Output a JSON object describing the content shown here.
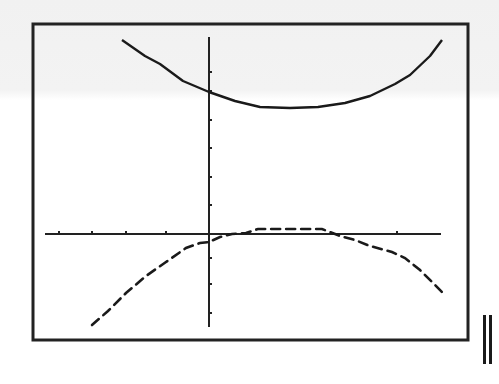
{
  "screen": {
    "title": "",
    "window": "calculator-graph-screen",
    "frame_color": "#222222",
    "background_color": "#ffffff"
  },
  "chart_data": {
    "type": "line",
    "title": "",
    "xlabel": "",
    "ylabel": "",
    "grid": false,
    "legend": null,
    "axes": {
      "x_ticks_px": [
        59,
        92,
        126,
        166,
        397
      ],
      "y_ticks_px": [
        72,
        91,
        120,
        148,
        177,
        205,
        258,
        284,
        313
      ],
      "x_axis_y_px": 234,
      "y_axis_x_px": 209,
      "x_range_px": [
        45,
        441
      ],
      "y_range_px": [
        37,
        327
      ],
      "approx_xlim": [
        -5,
        7
      ],
      "approx_ylim": [
        -3,
        6
      ]
    },
    "series": [
      {
        "name": "upper-curve",
        "style": "solid-with-gaps",
        "description": "Upward-opening parabola above the x-axis, vertex near x≈2.8 units right of the y-axis",
        "points_px": [
          [
            122,
            40
          ],
          [
            145,
            56
          ],
          [
            160,
            64
          ],
          [
            183,
            81
          ],
          [
            209,
            92
          ],
          [
            235,
            101
          ],
          [
            260,
            107
          ],
          [
            290,
            108
          ],
          [
            318,
            107
          ],
          [
            345,
            103
          ],
          [
            370,
            96
          ],
          [
            395,
            84
          ],
          [
            410,
            75
          ],
          [
            430,
            56
          ],
          [
            442,
            40
          ]
        ]
      },
      {
        "name": "lower-curve",
        "style": "dashed",
        "description": "Downward-opening curve below/near the x-axis, flat top just above the x-axis",
        "points_px": [
          [
            92,
            325
          ],
          [
            108,
            311
          ],
          [
            126,
            293
          ],
          [
            146,
            276
          ],
          [
            166,
            262
          ],
          [
            186,
            248
          ],
          [
            200,
            243
          ],
          [
            209,
            242
          ],
          [
            220,
            237
          ],
          [
            232,
            234
          ],
          [
            246,
            233
          ],
          [
            258,
            229
          ],
          [
            290,
            229
          ],
          [
            322,
            229
          ],
          [
            340,
            236
          ],
          [
            355,
            240
          ],
          [
            370,
            246
          ],
          [
            392,
            252
          ],
          [
            405,
            258
          ],
          [
            420,
            270
          ],
          [
            442,
            292
          ]
        ]
      }
    ]
  },
  "indicators": {
    "pause_icon": "pause-icon"
  }
}
